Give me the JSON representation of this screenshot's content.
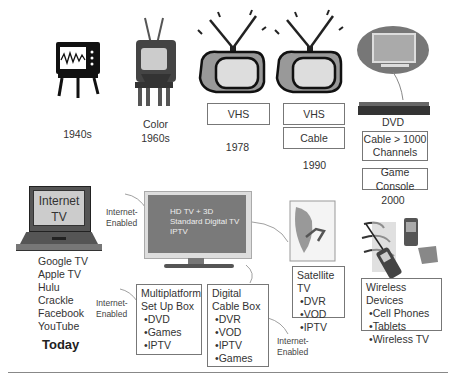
{
  "eras": [
    {
      "id": "1940s",
      "label": "1940s"
    },
    {
      "id": "1960s",
      "label_lines": [
        "Color",
        "1960s"
      ]
    },
    {
      "id": "1978",
      "label": "1978",
      "boxes": [
        "VHS"
      ]
    },
    {
      "id": "1990",
      "label": "1990",
      "boxes": [
        "VHS",
        "Cable"
      ]
    },
    {
      "id": "2000",
      "label": "2000",
      "device_label": "DVD",
      "boxes": [
        "Cable > 1000 Channels",
        "Game Console"
      ]
    }
  ],
  "today": {
    "laptop_screen_text": [
      "Internet",
      "TV"
    ],
    "services": [
      "Google TV",
      "Apple TV",
      "Hulu",
      "Crackle",
      "Facebook",
      "YouTube"
    ],
    "label": "Today",
    "tv_screen_lines": [
      "HD TV + 3D",
      "Standard Digital TV",
      "IPTV"
    ],
    "internet_enabled_labels": [
      "Internet-",
      "Enabled"
    ],
    "multiplatform": {
      "title_lines": [
        "Multiplatform",
        "Set Up Box"
      ],
      "items": [
        "DVD",
        "Games",
        "IPTV"
      ]
    },
    "digital_cable": {
      "title_lines": [
        "Digital",
        "Cable Box"
      ],
      "items": [
        "DVR",
        "VOD",
        "IPTV",
        "Games"
      ]
    },
    "satellite": {
      "title": "Satellite TV",
      "items": [
        "DVR",
        "VOD",
        "IPTV"
      ]
    },
    "wireless": {
      "title": "Wireless Devices",
      "items": [
        "Cell Phones",
        "Tablets",
        "Wireless TV"
      ]
    }
  },
  "colors": {
    "border": "#777777",
    "text": "#333333",
    "screen": "#8a8a8a",
    "dark": "#222222"
  }
}
